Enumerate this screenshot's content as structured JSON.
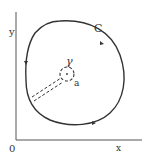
{
  "diagram": {
    "axes": {
      "origin_label": "0",
      "x_label": "x",
      "y_label": "y"
    },
    "curve": {
      "label": "C",
      "orientation": "counterclockwise"
    },
    "inner_circle": {
      "label": "γ",
      "point_label": "a",
      "style": "dashed"
    },
    "cut": {
      "style": "double dashed line connecting C to γ"
    },
    "colors": {
      "stroke": "#333333",
      "background": "#ffffff"
    }
  }
}
